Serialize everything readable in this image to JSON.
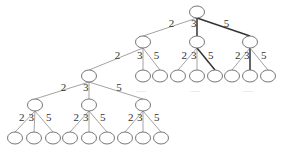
{
  "diagram": {
    "type": "tree",
    "branch_labels": [
      "2",
      "3",
      "5"
    ],
    "ellipsis": "......",
    "nodes": [
      {
        "id": "r",
        "x": 197,
        "y": 12
      },
      {
        "id": "a",
        "x": 143,
        "y": 42
      },
      {
        "id": "b",
        "x": 197,
        "y": 42
      },
      {
        "id": "c",
        "x": 250,
        "y": 42
      },
      {
        "id": "b1",
        "x": 178,
        "y": 76
      },
      {
        "id": "b2",
        "x": 197,
        "y": 76
      },
      {
        "id": "b3",
        "x": 215,
        "y": 76
      },
      {
        "id": "c1",
        "x": 232,
        "y": 76
      },
      {
        "id": "c2",
        "x": 250,
        "y": 76
      },
      {
        "id": "c3",
        "x": 268,
        "y": 76
      },
      {
        "id": "a2",
        "x": 143,
        "y": 76
      },
      {
        "id": "a3",
        "x": 160,
        "y": 76
      },
      {
        "id": "a1",
        "x": 89,
        "y": 76
      },
      {
        "id": "d1",
        "x": 35,
        "y": 105
      },
      {
        "id": "d2",
        "x": 89,
        "y": 105
      },
      {
        "id": "d3",
        "x": 143,
        "y": 105
      },
      {
        "id": "e1",
        "x": 15,
        "y": 138
      },
      {
        "id": "e2",
        "x": 34,
        "y": 138
      },
      {
        "id": "e3",
        "x": 53,
        "y": 138
      },
      {
        "id": "e4",
        "x": 70,
        "y": 138
      },
      {
        "id": "e5",
        "x": 89,
        "y": 138
      },
      {
        "id": "e6",
        "x": 107,
        "y": 138
      },
      {
        "id": "e7",
        "x": 125,
        "y": 138
      },
      {
        "id": "e8",
        "x": 143,
        "y": 138
      },
      {
        "id": "e9",
        "x": 161,
        "y": 138
      }
    ],
    "edges": [
      {
        "from": "r",
        "to": "a",
        "label": "2",
        "bold": false
      },
      {
        "from": "r",
        "to": "b",
        "label": "3",
        "bold": true
      },
      {
        "from": "r",
        "to": "c",
        "label": "5",
        "bold": true
      },
      {
        "from": "a",
        "to": "a1",
        "label": "2",
        "bold": false
      },
      {
        "from": "a",
        "to": "a2",
        "label": "3",
        "bold": false
      },
      {
        "from": "a",
        "to": "a3",
        "label": "5",
        "bold": false
      },
      {
        "from": "b",
        "to": "b1",
        "label": "2",
        "bold": false
      },
      {
        "from": "b",
        "to": "b2",
        "label": "3",
        "bold": false
      },
      {
        "from": "b",
        "to": "b3",
        "label": "5",
        "bold": true
      },
      {
        "from": "c",
        "to": "c1",
        "label": "2",
        "bold": false
      },
      {
        "from": "c",
        "to": "c2",
        "label": "3",
        "bold": true
      },
      {
        "from": "c",
        "to": "c3",
        "label": "5",
        "bold": false
      },
      {
        "from": "a1",
        "to": "d1",
        "label": "2",
        "bold": false
      },
      {
        "from": "a1",
        "to": "d2",
        "label": "3",
        "bold": false
      },
      {
        "from": "a1",
        "to": "d3",
        "label": "5",
        "bold": false
      },
      {
        "from": "d1",
        "to": "e1",
        "label": "2",
        "bold": false
      },
      {
        "from": "d1",
        "to": "e2",
        "label": "3",
        "bold": false
      },
      {
        "from": "d1",
        "to": "e3",
        "label": "5",
        "bold": false
      },
      {
        "from": "d2",
        "to": "e4",
        "label": "2",
        "bold": false
      },
      {
        "from": "d2",
        "to": "e5",
        "label": "3",
        "bold": false
      },
      {
        "from": "d2",
        "to": "e6",
        "label": "5",
        "bold": false
      },
      {
        "from": "d3",
        "to": "e7",
        "label": "2",
        "bold": false
      },
      {
        "from": "d3",
        "to": "e8",
        "label": "3",
        "bold": false
      },
      {
        "from": "d3",
        "to": "e9",
        "label": "5",
        "bold": false
      }
    ],
    "ellipses_positions": [
      {
        "x": 143,
        "y": 92
      },
      {
        "x": 197,
        "y": 92
      },
      {
        "x": 250,
        "y": 92
      }
    ]
  }
}
